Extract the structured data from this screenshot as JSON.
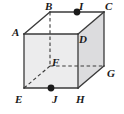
{
  "figure": {
    "type": "geometry-diagram",
    "shape": "cube",
    "background_color": "#ffffff",
    "edge_color": "#3a3a3a",
    "hidden_edge_style": "dashed",
    "front_face_fill": "#ececed",
    "right_face_fill": "#dcdcde",
    "top_face_fill": "#ffffff",
    "point_marker_color": "#1a1a1a",
    "label_color": "#1a1a1a"
  },
  "geometry": {
    "vertices": [
      {
        "id": "A",
        "x": 24,
        "y": 34,
        "hidden": false
      },
      {
        "id": "B",
        "x": 50,
        "y": 12,
        "hidden": false
      },
      {
        "id": "C",
        "x": 104,
        "y": 12,
        "hidden": false
      },
      {
        "id": "D",
        "x": 78,
        "y": 34,
        "hidden": false
      },
      {
        "id": "E",
        "x": 24,
        "y": 88,
        "hidden": false
      },
      {
        "id": "F",
        "x": 50,
        "y": 66,
        "hidden": true
      },
      {
        "id": "G",
        "x": 104,
        "y": 66,
        "hidden": false
      },
      {
        "id": "H",
        "x": 78,
        "y": 88,
        "hidden": false
      }
    ],
    "marked_points": [
      {
        "id": "I",
        "x": 77,
        "y": 12,
        "on_edge": "BC"
      },
      {
        "id": "J",
        "x": 51,
        "y": 88,
        "on_edge": "EH"
      }
    ],
    "solid_edges": [
      "A-B",
      "B-C",
      "C-D",
      "D-A",
      "A-E",
      "D-H",
      "C-G",
      "E-H",
      "H-G"
    ],
    "dashed_edges": [
      "B-F",
      "E-F",
      "F-G"
    ],
    "faces": [
      {
        "id": "front",
        "path": "A-D-H-E",
        "fill": "#ececed"
      },
      {
        "id": "right",
        "path": "D-C-G-H",
        "fill": "#dcdcde"
      },
      {
        "id": "top",
        "path": "A-B-C-D",
        "fill": "#ffffff"
      }
    ]
  },
  "labels": {
    "A": {
      "text": "A",
      "x": 12,
      "y": 27
    },
    "B": {
      "text": "B",
      "x": 45,
      "y": 1
    },
    "C": {
      "text": "C",
      "x": 105,
      "y": 1
    },
    "D": {
      "text": "D",
      "x": 79,
      "y": 34
    },
    "E": {
      "text": "E",
      "x": 15,
      "y": 94
    },
    "F": {
      "text": "F",
      "x": 52,
      "y": 57
    },
    "G": {
      "text": "G",
      "x": 107,
      "y": 68
    },
    "H": {
      "text": "H",
      "x": 76,
      "y": 94
    },
    "I": {
      "text": "I",
      "x": 79,
      "y": 1
    },
    "J": {
      "text": "J",
      "x": 52,
      "y": 94
    }
  }
}
